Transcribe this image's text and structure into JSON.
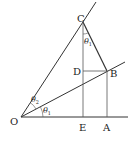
{
  "diagram": {
    "points": {
      "O": {
        "label": "O",
        "x": 21,
        "y": 117
      },
      "C": {
        "label": "C",
        "x": 83,
        "y": 22
      },
      "B": {
        "label": "B",
        "x": 107,
        "y": 71
      },
      "D": {
        "label": "D",
        "x": 83,
        "y": 71
      },
      "E": {
        "label": "E",
        "x": 83,
        "y": 117
      },
      "A": {
        "label": "A",
        "x": 107,
        "y": 117
      }
    },
    "angles": {
      "theta1_at_O": {
        "symbol": "θ",
        "sub": "1"
      },
      "theta2_at_O": {
        "symbol": "θ",
        "sub": "2"
      },
      "angle_at_C": {
        "symbol": "θ",
        "sub": "1"
      }
    },
    "colors": {
      "line": "#333333",
      "text": "#222222",
      "thin": "#555555"
    }
  }
}
